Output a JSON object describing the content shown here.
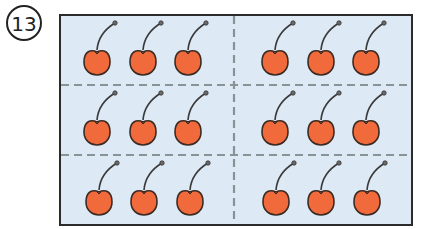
{
  "problem": {
    "number_label": "13",
    "number_glyph": "⑬"
  },
  "figure": {
    "background_color": "#dde9f5",
    "border_color": "#2b2b2b",
    "divider_color": "#8a9296",
    "cherry_color": "#f06a3c",
    "cherry_outline": "#3a2a22",
    "grid": {
      "columns": 2,
      "rows": 3,
      "cherries_per_cell": 3
    },
    "total_cherries": 18,
    "cells": [
      {
        "row": 1,
        "col": 1,
        "count": 3
      },
      {
        "row": 1,
        "col": 2,
        "count": 3
      },
      {
        "row": 2,
        "col": 1,
        "count": 3
      },
      {
        "row": 2,
        "col": 2,
        "count": 3
      },
      {
        "row": 3,
        "col": 1,
        "count": 3
      },
      {
        "row": 3,
        "col": 2,
        "count": 3
      }
    ]
  }
}
